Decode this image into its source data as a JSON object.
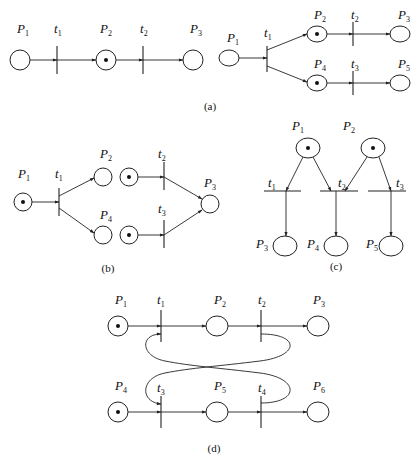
{
  "figure": {
    "panels": [
      {
        "id": "a",
        "caption": "(a)",
        "left": {
          "places": [
            {
              "name": "P",
              "sub": "1",
              "tokens": 0
            },
            {
              "name": "P",
              "sub": "2",
              "tokens": 1
            },
            {
              "name": "P",
              "sub": "3",
              "tokens": 0
            }
          ],
          "transitions": [
            {
              "name": "t",
              "sub": "1"
            },
            {
              "name": "t",
              "sub": "2"
            }
          ]
        },
        "right": {
          "places": [
            {
              "name": "P",
              "sub": "1",
              "tokens": 0
            },
            {
              "name": "P",
              "sub": "2",
              "tokens": 1
            },
            {
              "name": "P",
              "sub": "3",
              "tokens": 0
            },
            {
              "name": "P",
              "sub": "4",
              "tokens": 1
            },
            {
              "name": "P",
              "sub": "5",
              "tokens": 0
            }
          ],
          "transitions": [
            {
              "name": "t",
              "sub": "1"
            },
            {
              "name": "t",
              "sub": "2"
            },
            {
              "name": "t",
              "sub": "3"
            }
          ]
        }
      },
      {
        "id": "b",
        "caption": "(b)",
        "places": [
          {
            "name": "P",
            "sub": "1",
            "tokens": 1
          },
          {
            "name": "P",
            "sub": "2",
            "tokens": 0
          },
          {
            "name": "P",
            "sub": "4",
            "tokens": 0
          },
          {
            "name": "P",
            "sub": "3",
            "tokens": 0
          }
        ],
        "transitions": [
          {
            "name": "t",
            "sub": "1"
          },
          {
            "name": "t",
            "sub": "2"
          },
          {
            "name": "t",
            "sub": "3"
          }
        ]
      },
      {
        "id": "c",
        "caption": "(c)",
        "places": [
          {
            "name": "P",
            "sub": "1",
            "tokens": 1
          },
          {
            "name": "P",
            "sub": "2",
            "tokens": 1
          },
          {
            "name": "P",
            "sub": "3",
            "tokens": 0
          },
          {
            "name": "P",
            "sub": "4",
            "tokens": 0
          },
          {
            "name": "P",
            "sub": "5",
            "tokens": 0
          }
        ],
        "transitions": [
          {
            "name": "t",
            "sub": "1"
          },
          {
            "name": "t",
            "sub": "2"
          },
          {
            "name": "t",
            "sub": "3"
          }
        ]
      },
      {
        "id": "d",
        "caption": "(d)",
        "places": [
          {
            "name": "P",
            "sub": "1",
            "tokens": 1
          },
          {
            "name": "P",
            "sub": "2",
            "tokens": 0
          },
          {
            "name": "P",
            "sub": "3",
            "tokens": 0
          },
          {
            "name": "P",
            "sub": "4",
            "tokens": 1
          },
          {
            "name": "P",
            "sub": "5",
            "tokens": 0
          },
          {
            "name": "P",
            "sub": "6",
            "tokens": 0
          }
        ],
        "transitions": [
          {
            "name": "t",
            "sub": "1"
          },
          {
            "name": "t",
            "sub": "2"
          },
          {
            "name": "t",
            "sub": "3"
          },
          {
            "name": "t",
            "sub": "4"
          }
        ]
      }
    ]
  }
}
